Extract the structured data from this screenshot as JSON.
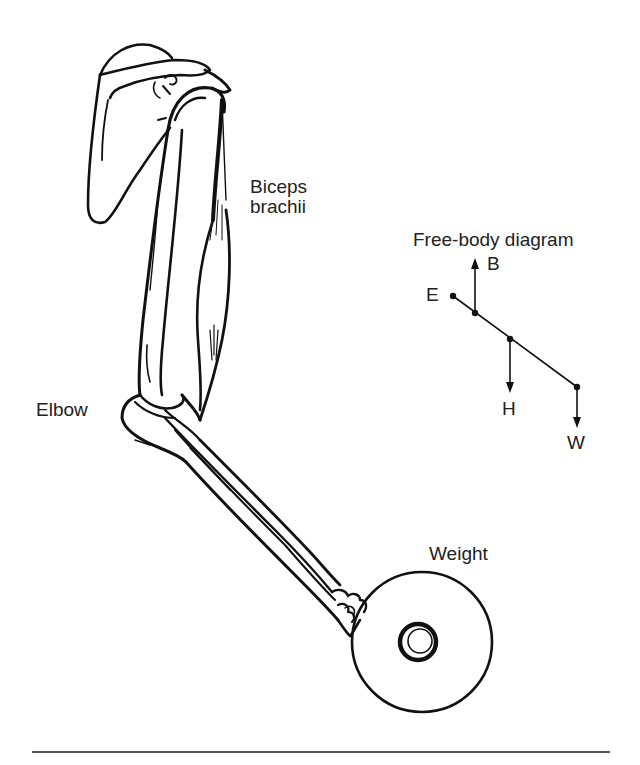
{
  "figure": {
    "type": "anatomical illustration with free-body diagram",
    "labels": {
      "biceps_line1": "Biceps",
      "biceps_line2": "brachii",
      "elbow": "Elbow",
      "weight": "Weight",
      "fbd_title": "Free-body diagram"
    },
    "free_body_diagram": {
      "points": [
        {
          "id": "E",
          "label": "E",
          "description": "elbow pivot"
        },
        {
          "id": "B",
          "label": "B",
          "direction": "up",
          "description": "biceps force"
        },
        {
          "id": "H",
          "label": "H",
          "direction": "down",
          "description": "forearm/hand weight"
        },
        {
          "id": "W",
          "label": "W",
          "direction": "down",
          "description": "held weight"
        }
      ]
    },
    "colors": {
      "ink": "#111111",
      "background": "#ffffff",
      "rule": "#555555"
    }
  }
}
